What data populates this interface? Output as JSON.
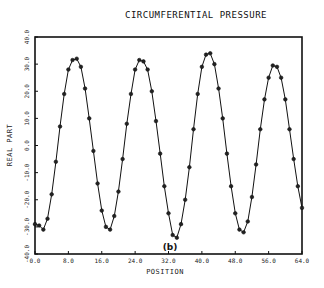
{
  "chart_data": {
    "type": "line",
    "title": "CIRCUMFERENTIAL PRESSURE",
    "xlabel": "POSITION",
    "ylabel": "REAL PART",
    "panel_label": "(b)",
    "xlim": [
      0,
      64
    ],
    "ylim": [
      -40,
      40
    ],
    "xticks": [
      "0.0",
      "8.0",
      "16.0",
      "24.0",
      "32.0",
      "40.0",
      "48.0",
      "56.0",
      "64.0"
    ],
    "yticks": [
      "-40.0",
      "-30.0",
      "-20.0",
      "-10.0",
      "0.0",
      "10.0",
      "20.0",
      "30.0",
      "40.0"
    ],
    "grid": false,
    "legend": null,
    "markers": true,
    "series": [
      {
        "name": "REAL PART",
        "x": [
          0,
          1,
          2,
          3,
          4,
          5,
          6,
          7,
          8,
          9,
          10,
          11,
          12,
          13,
          14,
          15,
          16,
          17,
          18,
          19,
          20,
          21,
          22,
          23,
          24,
          25,
          26,
          27,
          28,
          29,
          30,
          31,
          32,
          33,
          34,
          35,
          36,
          37,
          38,
          39,
          40,
          41,
          42,
          43,
          44,
          45,
          46,
          47,
          48,
          49,
          50,
          51,
          52,
          53,
          54,
          55,
          56,
          57,
          58,
          59,
          60,
          61,
          62,
          63,
          64
        ],
        "values": [
          -29,
          -29.5,
          -31,
          -27,
          -18,
          -6,
          7,
          19,
          28,
          31.5,
          32,
          29,
          21,
          10,
          -2,
          -14,
          -24,
          -30,
          -31,
          -26,
          -17,
          -5,
          8,
          19,
          28,
          31.5,
          31,
          28,
          20,
          9,
          -3,
          -15,
          -25,
          -33,
          -34,
          -29,
          -20,
          -8,
          6,
          19,
          29,
          33.5,
          34,
          30,
          21,
          10,
          -3,
          -15,
          -25,
          -31,
          -32,
          -28,
          -19,
          -7,
          6,
          17,
          25,
          29.5,
          29,
          25,
          17,
          6,
          -5,
          -15,
          -23
        ]
      }
    ]
  },
  "header": {
    "title": "CIRCUMFERENTIAL PRESSURE"
  }
}
